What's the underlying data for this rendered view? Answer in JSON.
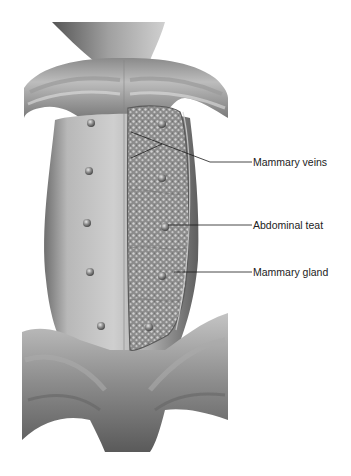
{
  "figure": {
    "palette": {
      "background": "#ffffff",
      "skin_light": "#c8c8c8",
      "skin_mid": "#a4a4a4",
      "skin_dark": "#6e6e6e",
      "gland_fill": "#8f8f8f",
      "gland_dots": "#d4d4d4",
      "leader_line": "#1a1a1a",
      "label_text": "#222222"
    },
    "teats_left": [
      {
        "x": 91,
        "y": 123
      },
      {
        "x": 89,
        "y": 171
      },
      {
        "x": 87,
        "y": 223
      },
      {
        "x": 90,
        "y": 272
      },
      {
        "x": 101,
        "y": 326
      }
    ],
    "teats_right": [
      {
        "x": 162,
        "y": 124
      },
      {
        "x": 162,
        "y": 178
      },
      {
        "x": 165,
        "y": 227
      },
      {
        "x": 162,
        "y": 276
      },
      {
        "x": 149,
        "y": 327
      }
    ]
  },
  "labels": [
    {
      "id": "mammary-veins",
      "text": "Mammary veins",
      "x": 253,
      "y": 157
    },
    {
      "id": "abdominal-teat",
      "text": "Abdominal teat",
      "x": 253,
      "y": 221
    },
    {
      "id": "mammary-gland",
      "text": "Mammary gland",
      "x": 253,
      "y": 270
    }
  ]
}
